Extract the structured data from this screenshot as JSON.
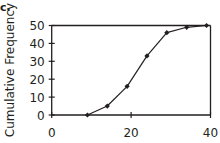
{
  "part_label": "c.",
  "chart_data": {
    "type": "line",
    "title": "",
    "xlabel": "",
    "ylabel": "Cumulative Frequency",
    "x": [
      9,
      14,
      19,
      24,
      29,
      34,
      39
    ],
    "series": [
      {
        "name": "Cumulative Frequency",
        "values": [
          0,
          5,
          16,
          33,
          46,
          49,
          50
        ]
      }
    ],
    "xlim": [
      0,
      40
    ],
    "ylim": [
      0,
      50
    ],
    "xticks": [
      0,
      20,
      40
    ],
    "yticks": [
      0,
      10,
      20,
      30,
      40,
      50
    ],
    "xtick_labels": [
      "0",
      "20",
      "40"
    ],
    "ytick_labels": [
      "0",
      "10",
      "20",
      "30",
      "40",
      "50"
    ],
    "marker": "diamond",
    "grid": false,
    "legend": "none",
    "line_color": "#231f20"
  }
}
